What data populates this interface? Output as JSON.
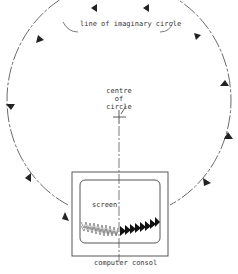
{
  "diagram": {
    "labels": {
      "circle_line": "line of imaginary circle",
      "centre_line1": "centre",
      "centre_line2": "of",
      "centre_line3": "circle",
      "screen": "screen",
      "console": "computer consol"
    },
    "colors": {
      "stroke": "#333333",
      "background": "#ffffff"
    }
  }
}
